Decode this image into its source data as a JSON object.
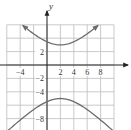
{
  "chart_data": {
    "type": "line",
    "title": "",
    "xlabel": "",
    "ylabel": "y",
    "xlim": [
      -6,
      10
    ],
    "ylim": [
      -10,
      6
    ],
    "grid": true,
    "grid_step": 2,
    "x_tick_labels": [
      "-4",
      "2",
      "4",
      "6",
      "8"
    ],
    "y_tick_labels": [
      "2",
      "-2",
      "-4",
      "-8"
    ],
    "equation": "(y+1)^2/16 - (x-2)^2/16 = 1",
    "center": [
      2,
      -1
    ],
    "vertices": [
      [
        2,
        3
      ],
      [
        2,
        -5
      ]
    ],
    "series": [
      {
        "name": "upper branch",
        "x": [
          -3.6,
          -2,
          0,
          2,
          4,
          6,
          7.6
        ],
        "y": [
          5.9,
          4.7,
          3.5,
          3,
          3.5,
          4.7,
          5.9
        ]
      },
      {
        "name": "lower branch",
        "x": [
          -6,
          -4,
          -2,
          0,
          2,
          4,
          6,
          8,
          10
        ],
        "y": [
          -9.9,
          -8.2,
          -6.7,
          -5.5,
          -5,
          -5.5,
          -6.7,
          -8.2,
          -9.9
        ]
      }
    ],
    "colors": {
      "curve": "#6b6b6b",
      "grid": "#bdbdbd",
      "axis": "#222222"
    }
  },
  "labels": {
    "y_axis": "y",
    "x_ticks": [
      {
        "text": "-4",
        "x": -4
      },
      {
        "text": "2",
        "x": 2
      },
      {
        "text": "4",
        "x": 4
      },
      {
        "text": "6",
        "x": 6
      },
      {
        "text": "8",
        "x": 8
      }
    ],
    "y_ticks": [
      {
        "text": "2",
        "y": 2
      },
      {
        "text": "-2",
        "y": -2
      },
      {
        "text": "-4",
        "y": -4
      },
      {
        "text": "-8",
        "y": -8
      }
    ]
  }
}
